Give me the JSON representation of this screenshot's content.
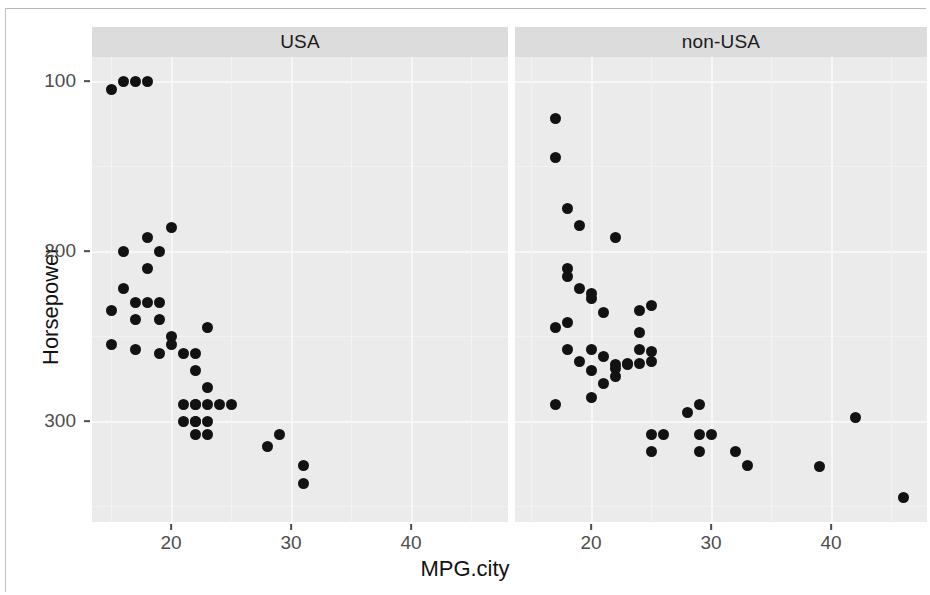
{
  "chart_data": {
    "type": "scatter",
    "title": "",
    "xlabel": "MPG.city",
    "ylabel": "Horsepower",
    "xlim": [
      13,
      48
    ],
    "ylim": [
      48,
      320
    ],
    "xticks": [
      20,
      30,
      40
    ],
    "yticks": [
      100,
      200,
      300
    ],
    "grid": true,
    "legend": "none",
    "facet_variable": "Origin",
    "panels": [
      {
        "label": "USA",
        "x_name": "MPG.city",
        "y_name": "Horsepower",
        "points": [
          {
            "x": 15,
            "y": 295
          },
          {
            "x": 16,
            "y": 300
          },
          {
            "x": 17,
            "y": 300
          },
          {
            "x": 18,
            "y": 300
          },
          {
            "x": 20,
            "y": 214
          },
          {
            "x": 18,
            "y": 208
          },
          {
            "x": 16,
            "y": 200
          },
          {
            "x": 19,
            "y": 200
          },
          {
            "x": 18,
            "y": 190
          },
          {
            "x": 16,
            "y": 178
          },
          {
            "x": 17,
            "y": 170
          },
          {
            "x": 18,
            "y": 170
          },
          {
            "x": 19,
            "y": 170
          },
          {
            "x": 15,
            "y": 165
          },
          {
            "x": 17,
            "y": 160
          },
          {
            "x": 19,
            "y": 160
          },
          {
            "x": 23,
            "y": 155
          },
          {
            "x": 20,
            "y": 150
          },
          {
            "x": 20,
            "y": 145
          },
          {
            "x": 15,
            "y": 145
          },
          {
            "x": 17,
            "y": 142
          },
          {
            "x": 19,
            "y": 140
          },
          {
            "x": 21,
            "y": 140
          },
          {
            "x": 22,
            "y": 140
          },
          {
            "x": 22,
            "y": 130
          },
          {
            "x": 23,
            "y": 120
          },
          {
            "x": 21,
            "y": 110
          },
          {
            "x": 22,
            "y": 110
          },
          {
            "x": 22,
            "y": 110
          },
          {
            "x": 23,
            "y": 110
          },
          {
            "x": 24,
            "y": 110
          },
          {
            "x": 25,
            "y": 110
          },
          {
            "x": 21,
            "y": 100
          },
          {
            "x": 22,
            "y": 100
          },
          {
            "x": 22,
            "y": 100
          },
          {
            "x": 23,
            "y": 100
          },
          {
            "x": 22,
            "y": 92
          },
          {
            "x": 23,
            "y": 92
          },
          {
            "x": 29,
            "y": 92
          },
          {
            "x": 28,
            "y": 85
          },
          {
            "x": 31,
            "y": 74
          },
          {
            "x": 31,
            "y": 63
          }
        ]
      },
      {
        "label": "non-USA",
        "x_name": "MPG.city",
        "y_name": "Horsepower",
        "points": [
          {
            "x": 17,
            "y": 278
          },
          {
            "x": 17,
            "y": 255
          },
          {
            "x": 18,
            "y": 225
          },
          {
            "x": 19,
            "y": 215
          },
          {
            "x": 22,
            "y": 208
          },
          {
            "x": 18,
            "y": 190
          },
          {
            "x": 18,
            "y": 185
          },
          {
            "x": 19,
            "y": 178
          },
          {
            "x": 20,
            "y": 175
          },
          {
            "x": 20,
            "y": 172
          },
          {
            "x": 21,
            "y": 164
          },
          {
            "x": 24,
            "y": 165
          },
          {
            "x": 25,
            "y": 168
          },
          {
            "x": 17,
            "y": 155
          },
          {
            "x": 18,
            "y": 158
          },
          {
            "x": 24,
            "y": 152
          },
          {
            "x": 18,
            "y": 142
          },
          {
            "x": 20,
            "y": 142
          },
          {
            "x": 24,
            "y": 142
          },
          {
            "x": 25,
            "y": 141
          },
          {
            "x": 19,
            "y": 135
          },
          {
            "x": 21,
            "y": 138
          },
          {
            "x": 24,
            "y": 134
          },
          {
            "x": 25,
            "y": 135
          },
          {
            "x": 20,
            "y": 130
          },
          {
            "x": 22,
            "y": 133
          },
          {
            "x": 22,
            "y": 131
          },
          {
            "x": 23,
            "y": 134
          },
          {
            "x": 23,
            "y": 133
          },
          {
            "x": 22,
            "y": 126
          },
          {
            "x": 21,
            "y": 122
          },
          {
            "x": 17,
            "y": 110
          },
          {
            "x": 20,
            "y": 114
          },
          {
            "x": 29,
            "y": 110
          },
          {
            "x": 28,
            "y": 105
          },
          {
            "x": 42,
            "y": 102
          },
          {
            "x": 25,
            "y": 92
          },
          {
            "x": 26,
            "y": 92
          },
          {
            "x": 29,
            "y": 92
          },
          {
            "x": 30,
            "y": 92
          },
          {
            "x": 25,
            "y": 82
          },
          {
            "x": 29,
            "y": 82
          },
          {
            "x": 32,
            "y": 82
          },
          {
            "x": 33,
            "y": 74
          },
          {
            "x": 39,
            "y": 73
          },
          {
            "x": 46,
            "y": 55
          }
        ]
      }
    ]
  },
  "axes": {
    "y_title": "Horsepower",
    "x_title": "MPG.city",
    "y_tick_labels": [
      "300",
      "200",
      "100"
    ],
    "x_tick_labels_left": [
      "20",
      "30",
      "40"
    ],
    "x_tick_labels_right": [
      "20",
      "30",
      "40"
    ]
  },
  "strips": {
    "left_label": "USA",
    "right_label": "non-USA"
  },
  "colors": {
    "point": "#121212",
    "panel_bg": "#ebebeb",
    "strip_bg": "#dcdcdc",
    "grid": "#f7f7f7",
    "axis_text": "#4d4d4d",
    "title_text": "#121212"
  }
}
